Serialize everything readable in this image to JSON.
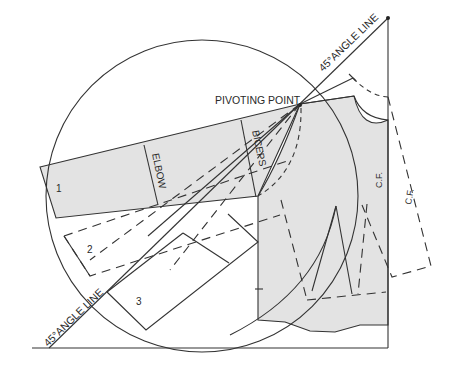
{
  "diagram": {
    "type": "pattern-drafting",
    "labels": {
      "pivot": "PIVOTING POINT",
      "angle_top": "45°ANGLE LINE",
      "angle_bottom": "45°ANGLE LINE",
      "elbow": "ELBOW",
      "biceps": "BICEPS",
      "cf_bodice": "C.F.",
      "cf_dashed": "C.F."
    },
    "positions": {
      "one": "1",
      "two": "2",
      "three": "3"
    },
    "colors": {
      "line": "#333333",
      "fill": "#e3e3e3",
      "background": "#ffffff"
    }
  }
}
